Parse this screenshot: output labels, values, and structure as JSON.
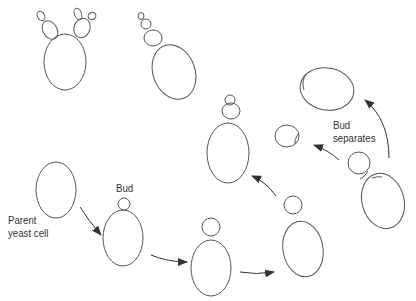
{
  "diagram": {
    "labels": {
      "parent": [
        "Parent",
        "yeast cell"
      ],
      "bud": "Bud",
      "separates": [
        "Bud",
        "separates"
      ]
    },
    "colors": {
      "stroke": "#555555",
      "arrow": "#333333",
      "text": "#333333"
    }
  }
}
